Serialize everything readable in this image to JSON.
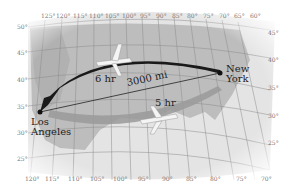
{
  "map": {
    "route": {
      "from": "Los Angeles",
      "to": "New York",
      "distance_label": "3000 mi",
      "westbound_duration": "6 hr",
      "eastbound_duration": "5 hr"
    },
    "cities": [
      {
        "line1": "New",
        "line2": "York"
      },
      {
        "line1": "Los",
        "line2": "Angeles"
      }
    ],
    "top_longitudes": [
      "125°",
      "120°",
      "115°",
      "110°",
      "105°",
      "100°",
      "95°",
      "90°",
      "85°",
      "80°",
      "75°",
      "70°",
      "65°",
      "60°"
    ],
    "bottom_longitudes": [
      "120°",
      "115°",
      "110°",
      "105°",
      "100°",
      "95°",
      "90°",
      "85°",
      "80°",
      "75°",
      "70°"
    ],
    "left_latitudes": [
      "50°",
      "45°",
      "40°",
      "35°",
      "30°",
      "25°"
    ],
    "right_latitudes": [
      "45°",
      "40°",
      "35°",
      "30°",
      "25°"
    ],
    "colors": {
      "dark_arrow": "#1a1a1a",
      "light_arrow": "#9a9a9a",
      "land": "#c8c8c8",
      "water": "#e6e6e6"
    }
  }
}
